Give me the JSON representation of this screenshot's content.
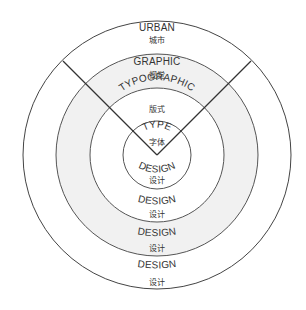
{
  "diagram": {
    "center": {
      "x": 157,
      "y": 155
    },
    "colors": {
      "stroke": "#444444",
      "ring_fill_highlight": "#f1f1f1",
      "background": "#ffffff",
      "text": "#333333"
    },
    "rings": [
      {
        "id": "urban",
        "radius": 134,
        "label_en": "URBAN",
        "label_zh": "城市",
        "design_en": "DESIGN",
        "design_zh": "设计"
      },
      {
        "id": "graphic",
        "radius": 101,
        "label_en": "GRAPHIC",
        "label_zh": "视觉",
        "design_en": "DESIGN",
        "design_zh": "设计"
      },
      {
        "id": "typographic",
        "radius": 67,
        "label_en": "TYPOGRAPHIC",
        "label_zh": "版式",
        "design_en": "DESIGN",
        "design_zh": "设计"
      },
      {
        "id": "type",
        "radius": 34,
        "label_en": "TYPE",
        "label_zh": "字体",
        "design_en": "DESIGN",
        "design_zh": "设计"
      }
    ],
    "wedge": {
      "angle_left_deg": 135,
      "angle_right_deg": 45
    }
  }
}
